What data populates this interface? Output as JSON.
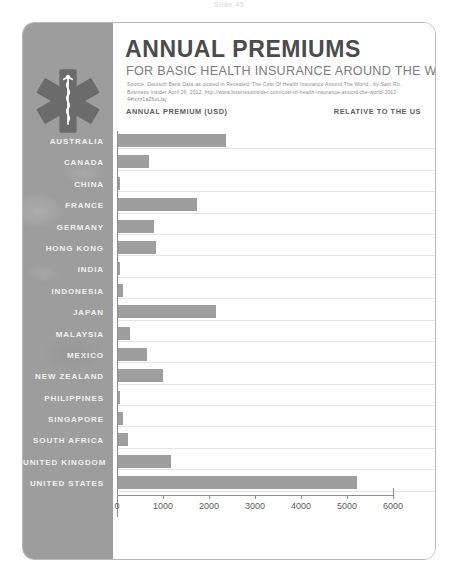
{
  "slide_stub": "Slide 45",
  "card": {
    "icon_name": "star-of-life-icon",
    "title": "ANNUAL PREMIUMS",
    "subtitle": "FOR BASIC HEALTH INSURANCE AROUND THE WORLD",
    "source": "Source:  Deutsch Bank Data as quoted in Revealed: The Cost Of Health Insurance Around The World.. by Sam Ro.  Business Insider April 26, 2012. http://www.businessinsider.com/cost-of-health-insurance-around-the-world-2012-4#ixzz1aZ6uLfaj",
    "column_header_left": "ANNUAL PREMIUM (USD)",
    "column_header_right": "RELATIVE TO THE US"
  },
  "colors": {
    "rail": "#9d9d9d",
    "bar": "#9e9e9e",
    "title": "#4b4b4b",
    "subtitle": "#7c7c7c",
    "gridline": "#e3e3e3",
    "axis": "#8c8c8c",
    "card_border": "#b9b9b9",
    "label_text": "#f1f1f1"
  },
  "chart_data": {
    "type": "bar",
    "orientation": "horizontal",
    "title": "ANNUAL PREMIUMS",
    "subtitle": "FOR BASIC HEALTH INSURANCE AROUND THE WORLD",
    "xlabel": "ANNUAL PREMIUM (USD)",
    "ylabel": "",
    "xlim": [
      0,
      6000
    ],
    "xticks": [
      0,
      1000,
      2000,
      3000,
      4000,
      5000,
      6000
    ],
    "xtick_labels": [
      "0",
      "1000",
      "2000",
      "3000",
      "4000",
      "5000",
      "6000"
    ],
    "grid": true,
    "legend": false,
    "categories": [
      "AUSTRALIA",
      "CANADA",
      "CHINA",
      "FRANCE",
      "GERMANY",
      "HONG KONG",
      "INDIA",
      "INDONESIA",
      "JAPAN",
      "MALAYSIA",
      "MEXICO",
      "NEW ZEALAND",
      "PHILIPPINES",
      "SINGAPORE",
      "SOUTH AFRICA",
      "UNITED KINGDOM",
      "UNITED STATES"
    ],
    "values": [
      2340,
      676,
      52,
      1716,
      780,
      832,
      52,
      104,
      2132,
      260,
      624,
      988,
      52,
      104,
      208,
      1144,
      5200
    ],
    "annotations": {
      "label": "RELATIVE TO THE US",
      "values": [
        "45%",
        "13%",
        "1%",
        "33%",
        "15%",
        "16%",
        "1%",
        "2%",
        "41%",
        "5%",
        "12%",
        "19%",
        "1%",
        "2%",
        "4%",
        "22%",
        "100%"
      ]
    }
  }
}
